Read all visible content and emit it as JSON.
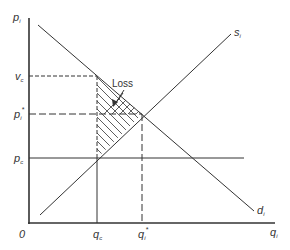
{
  "diagram": {
    "type": "supply-demand price ceiling (deadweight loss)",
    "axes": {
      "y_label": {
        "main": "p",
        "sub": "i"
      },
      "x_label": {
        "main": "q",
        "sub": "i"
      },
      "origin_label": "0"
    },
    "curves": {
      "supply": {
        "main": "s",
        "sub": "i"
      },
      "demand": {
        "main": "d",
        "sub": "i"
      }
    },
    "price_levels": {
      "v_c": {
        "main": "v",
        "sub": "c"
      },
      "p_star": {
        "main": "p",
        "sub": "i",
        "sup": "*"
      },
      "p_c": {
        "main": "p",
        "sub": "c"
      }
    },
    "quantity_levels": {
      "q_c": {
        "main": "q",
        "sub": "c"
      },
      "q_star": {
        "main": "q",
        "sub": "i",
        "sup": "*"
      }
    },
    "annotation": {
      "loss_label": "Loss"
    },
    "colors": {
      "line": "#333333",
      "background": "#ffffff"
    }
  }
}
